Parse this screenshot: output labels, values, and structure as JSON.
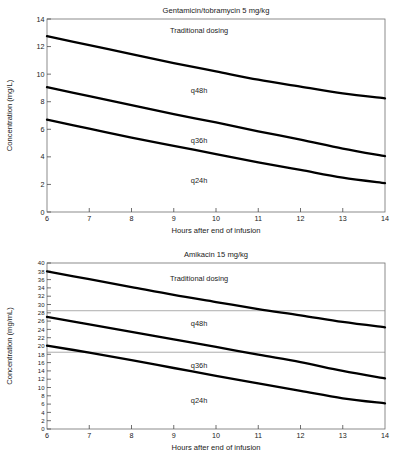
{
  "figure": {
    "background": "#ffffff",
    "curve_color": "#000000",
    "frame_color": "#6f6f6f",
    "refline_color": "#8a8a8a"
  },
  "chart_data": [
    {
      "id": "gentamicin",
      "type": "line",
      "title": "Gentamicin/tobramycin 5 mg/kg",
      "xlabel": "Hours after end of infusion",
      "ylabel": "Concentration (mg/L)",
      "xlim": [
        6,
        14
      ],
      "ylim": [
        0,
        14
      ],
      "xticks": [
        6,
        7,
        8,
        9,
        10,
        11,
        12,
        13,
        14
      ],
      "xticklabels": [
        "6",
        "7",
        "8",
        "9",
        "10",
        "11",
        "12",
        "13",
        "14"
      ],
      "yticks": [
        0,
        2,
        4,
        6,
        8,
        10,
        12,
        14
      ],
      "yticklabels": [
        "0",
        "2",
        "4",
        "6",
        "8",
        "10",
        "12",
        "14"
      ],
      "grid": false,
      "legend": "none",
      "reference_lines": [],
      "series": [
        {
          "name": "q48h-boundary",
          "x": [
            6,
            7,
            8,
            9,
            10,
            11,
            12,
            13,
            14
          ],
          "values": [
            12.75,
            12.1,
            11.45,
            10.8,
            10.2,
            9.6,
            9.1,
            8.6,
            8.25
          ]
        },
        {
          "name": "q36h-boundary",
          "x": [
            6,
            7,
            8,
            9,
            10,
            11,
            12,
            13,
            14
          ],
          "values": [
            9.05,
            8.4,
            7.75,
            7.1,
            6.5,
            5.85,
            5.25,
            4.6,
            4.05
          ]
        },
        {
          "name": "q24h-boundary",
          "x": [
            6,
            7,
            8,
            9,
            10,
            11,
            12,
            13,
            14
          ],
          "values": [
            6.7,
            6.05,
            5.4,
            4.8,
            4.2,
            3.6,
            3.05,
            2.5,
            2.1
          ]
        }
      ],
      "region_labels": [
        {
          "text": "Traditional dosing",
          "x": 9.6,
          "y": 13.0
        },
        {
          "text": "q48h",
          "x": 9.6,
          "y": 8.6
        },
        {
          "text": "q36h",
          "x": 9.6,
          "y": 5.0
        },
        {
          "text": "q24h",
          "x": 9.6,
          "y": 2.1
        }
      ]
    },
    {
      "id": "amikacin",
      "type": "line",
      "title": "Amikacin 15 mg/kg",
      "xlabel": "Hours after end of infusion",
      "ylabel": "Concentration (mg/mL)",
      "xlim": [
        6,
        14
      ],
      "ylim": [
        0,
        40
      ],
      "xticks": [
        6,
        7,
        8,
        9,
        10,
        11,
        12,
        13,
        14
      ],
      "xticklabels": [
        "6",
        "7",
        "8",
        "9",
        "10",
        "11",
        "12",
        "13",
        "14"
      ],
      "yticks": [
        0,
        2,
        4,
        6,
        8,
        10,
        12,
        14,
        16,
        18,
        20,
        22,
        24,
        26,
        28,
        30,
        32,
        34,
        36,
        38,
        40
      ],
      "yticklabels": [
        "0",
        "2",
        "4",
        "6",
        "8",
        "10",
        "12",
        "14",
        "16",
        "18",
        "20",
        "22",
        "24",
        "26",
        "28",
        "30",
        "32",
        "34",
        "36",
        "38",
        "40"
      ],
      "grid": false,
      "legend": "none",
      "reference_lines": [
        {
          "name": "upper-reference",
          "y": 28.5
        },
        {
          "name": "lower-reference",
          "y": 18.5
        }
      ],
      "series": [
        {
          "name": "q48h-boundary",
          "x": [
            6,
            7,
            8,
            9,
            10,
            11,
            12,
            13,
            14
          ],
          "values": [
            38.0,
            36.1,
            34.2,
            32.3,
            30.6,
            28.9,
            27.4,
            25.8,
            24.5
          ]
        },
        {
          "name": "q36h-boundary",
          "x": [
            6,
            7,
            8,
            9,
            10,
            11,
            12,
            13,
            14
          ],
          "values": [
            27.0,
            25.2,
            23.4,
            21.6,
            19.8,
            17.9,
            16.1,
            14.0,
            12.2
          ]
        },
        {
          "name": "q24h-boundary",
          "x": [
            6,
            7,
            8,
            9,
            10,
            11,
            12,
            13,
            14
          ],
          "values": [
            20.1,
            18.4,
            16.6,
            14.7,
            12.8,
            11.0,
            9.2,
            7.4,
            6.2
          ]
        }
      ],
      "region_labels": [
        {
          "text": "Traditional dosing",
          "x": 9.6,
          "y": 35.6
        },
        {
          "text": "q48h",
          "x": 9.6,
          "y": 24.7
        },
        {
          "text": "q36h",
          "x": 9.6,
          "y": 14.6
        },
        {
          "text": "q24h",
          "x": 9.6,
          "y": 6.3
        }
      ]
    }
  ]
}
